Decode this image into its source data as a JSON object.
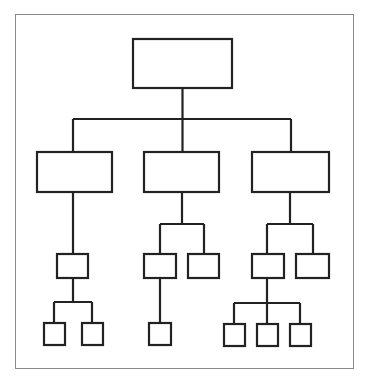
{
  "diagram": {
    "type": "org-chart",
    "colors": {
      "stroke": "#222222",
      "frame": "#8a8a8a",
      "background": "#ffffff"
    },
    "stroke_width": 2.2,
    "frame": {
      "x": 15,
      "y": 14,
      "w": 339,
      "h": 355
    },
    "nodes": [
      {
        "id": "root",
        "x": 133,
        "y": 39,
        "w": 99,
        "h": 49
      },
      {
        "id": "a",
        "x": 37,
        "y": 152,
        "w": 75,
        "h": 40
      },
      {
        "id": "b",
        "x": 144,
        "y": 152,
        "w": 75,
        "h": 40
      },
      {
        "id": "c",
        "x": 252,
        "y": 152,
        "w": 77,
        "h": 40
      },
      {
        "id": "a1",
        "x": 57,
        "y": 254,
        "w": 31,
        "h": 24
      },
      {
        "id": "b1",
        "x": 144,
        "y": 254,
        "w": 32,
        "h": 24
      },
      {
        "id": "b2",
        "x": 188,
        "y": 254,
        "w": 31,
        "h": 24
      },
      {
        "id": "c1",
        "x": 252,
        "y": 254,
        "w": 32,
        "h": 24
      },
      {
        "id": "c2",
        "x": 296,
        "y": 254,
        "w": 33,
        "h": 24
      },
      {
        "id": "a1a",
        "x": 44,
        "y": 323,
        "w": 21,
        "h": 22
      },
      {
        "id": "a1b",
        "x": 82,
        "y": 323,
        "w": 21,
        "h": 22
      },
      {
        "id": "b1a",
        "x": 149,
        "y": 323,
        "w": 22,
        "h": 22
      },
      {
        "id": "c1a",
        "x": 224,
        "y": 324,
        "w": 21,
        "h": 22
      },
      {
        "id": "c1b",
        "x": 257,
        "y": 324,
        "w": 21,
        "h": 22
      },
      {
        "id": "c1c",
        "x": 290,
        "y": 324,
        "w": 21,
        "h": 22
      }
    ],
    "edges": [
      "M182.5 88 V119",
      "M73 119 H291",
      "M73 119 V152",
      "M182.5 119 V152",
      "M291 119 V152",
      "M73 192 V254",
      "M182 192 V224",
      "M160 224 H204",
      "M160 224 V254",
      "M204 224 V254",
      "M290 192 V224",
      "M267 224 H313",
      "M267 224 V254",
      "M313 224 V254",
      "M73 278 V302",
      "M54 302 H92",
      "M54 302 V323",
      "M92 302 V323",
      "M160 278 V323",
      "M267 278 V303",
      "M234 303 H300",
      "M234 303 V324",
      "M267 303 V324",
      "M300 303 V324"
    ]
  }
}
